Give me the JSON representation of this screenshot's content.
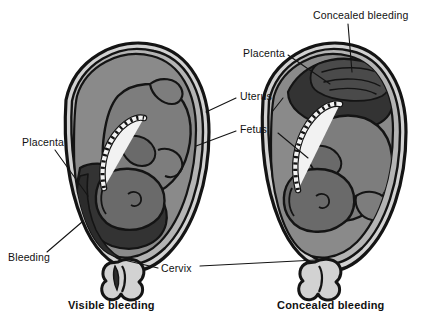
{
  "figure": {
    "type": "medical-illustration",
    "panels": [
      {
        "id": "left",
        "caption": "Visible bleeding",
        "description": "Sagittal section of gravid uterus with low-lying placenta; blood tracks down between membranes and uterine wall and escapes through the cervix."
      },
      {
        "id": "right",
        "caption": "Concealed bleeding",
        "description": "Sagittal section of gravid uterus with fundal placenta; blood collects behind the placenta and is retained within the uterus."
      }
    ]
  },
  "labels": {
    "placenta_left": "Placenta",
    "bleeding": "Bleeding",
    "uterus": "Uterus",
    "fetus": "Fetus",
    "placenta_right": "Placenta",
    "concealed_bleeding": "Concealed bleeding",
    "cervix": "Cervix"
  },
  "captions": {
    "left": "Visible bleeding",
    "right": "Concealed bleeding"
  },
  "colors": {
    "background": "#ffffff",
    "outline": "#141414",
    "uterine_wall_light": "#d2d2d2",
    "uterine_wall_mid": "#b4b4b4",
    "amniotic_cavity": "#8a8a8a",
    "fetus_body": "#7d7d7d",
    "fetus_shadow": "#6a6a6a",
    "placenta_dark": "#333333",
    "blood_dark": "#2b2b2b",
    "cord_light": "#f2f2f2",
    "label_text": "#111111"
  }
}
